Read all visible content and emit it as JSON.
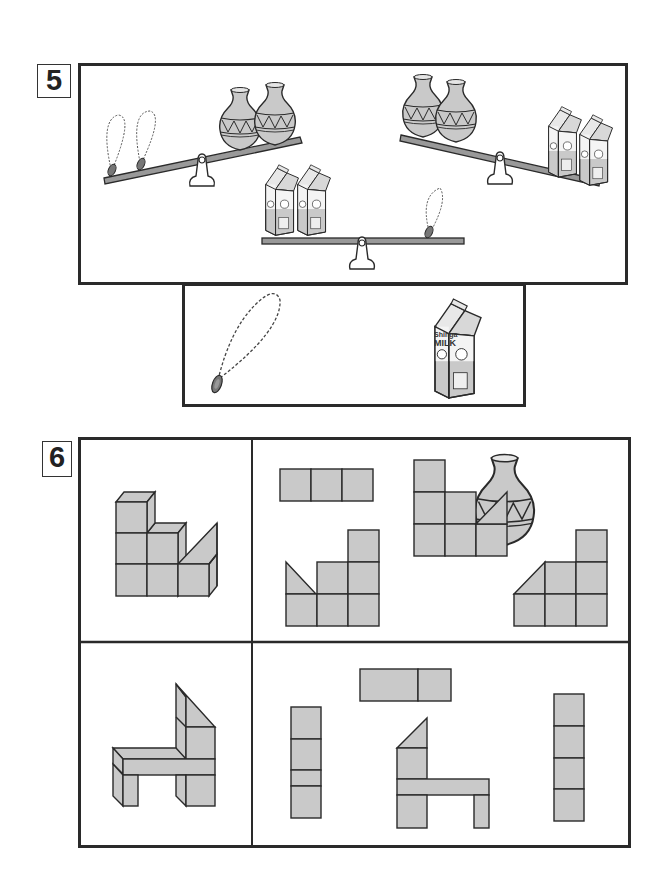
{
  "problems": [
    {
      "number": "5",
      "type": "balance-scale-puzzle",
      "scales": [
        {
          "left": "2 necklaces",
          "right": "2 vases",
          "heavier_side": "left"
        },
        {
          "left": "2 vases",
          "right": "2 milk cartons",
          "heavier_side": "right"
        },
        {
          "left": "2 milk cartons",
          "right": "1 necklace",
          "heavier_side": "balanced"
        }
      ],
      "answer_choices": [
        {
          "item": "necklace"
        },
        {
          "item": "vase"
        },
        {
          "item": "milk carton",
          "brand": "Shinga",
          "label": "MILK"
        }
      ]
    },
    {
      "number": "6",
      "type": "block-view-puzzle",
      "rows": [
        {
          "model": "stepped block figure with wedge",
          "views": [
            "3-block row (top view)",
            "side view with wedge left",
            "front view with wedge right",
            "side view with slope left"
          ]
        },
        {
          "model": "chair-shaped block figure",
          "views": [
            "vertical 4-block column (split)",
            "2-block top view",
            "chair front view",
            "vertical 4-block column"
          ]
        }
      ]
    }
  ],
  "carton": {
    "brand": "Shinga",
    "label": "MILK"
  },
  "colors": {
    "ink": "#2a2a2a",
    "fill_gray": "#c9c9c9",
    "background": "#ffffff"
  }
}
